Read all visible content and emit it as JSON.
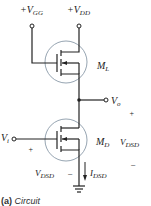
{
  "diagram": {
    "type": "circuit",
    "caption": {
      "tag": "(a)",
      "text": "Circuit"
    },
    "supplies": [
      {
        "id": "vgg",
        "sign": "+",
        "symbol": "V",
        "subscript": "GG"
      },
      {
        "id": "vdd",
        "sign": "+",
        "symbol": "V",
        "subscript": "DD"
      }
    ],
    "transistors": [
      {
        "id": "ML",
        "symbol": "M",
        "subscript": "L",
        "role": "load"
      },
      {
        "id": "MD",
        "symbol": "M",
        "subscript": "D",
        "role": "driver"
      }
    ],
    "terminals": {
      "input": {
        "symbol": "V",
        "subscript": "i"
      },
      "output": {
        "symbol": "V",
        "subscript": "o"
      }
    },
    "annotations": {
      "vdsd_right": {
        "symbol": "V",
        "subscript": "DSD",
        "plus": "+",
        "minus": "−"
      },
      "vdsd_left": {
        "symbol": "V",
        "subscript": "DSD",
        "plus": "+",
        "minus": "−"
      },
      "current": {
        "symbol": "I",
        "subscript": "DSD"
      }
    },
    "colors": {
      "wire": "#222222",
      "circle": "#8a9aa8",
      "text": "#222222"
    }
  }
}
